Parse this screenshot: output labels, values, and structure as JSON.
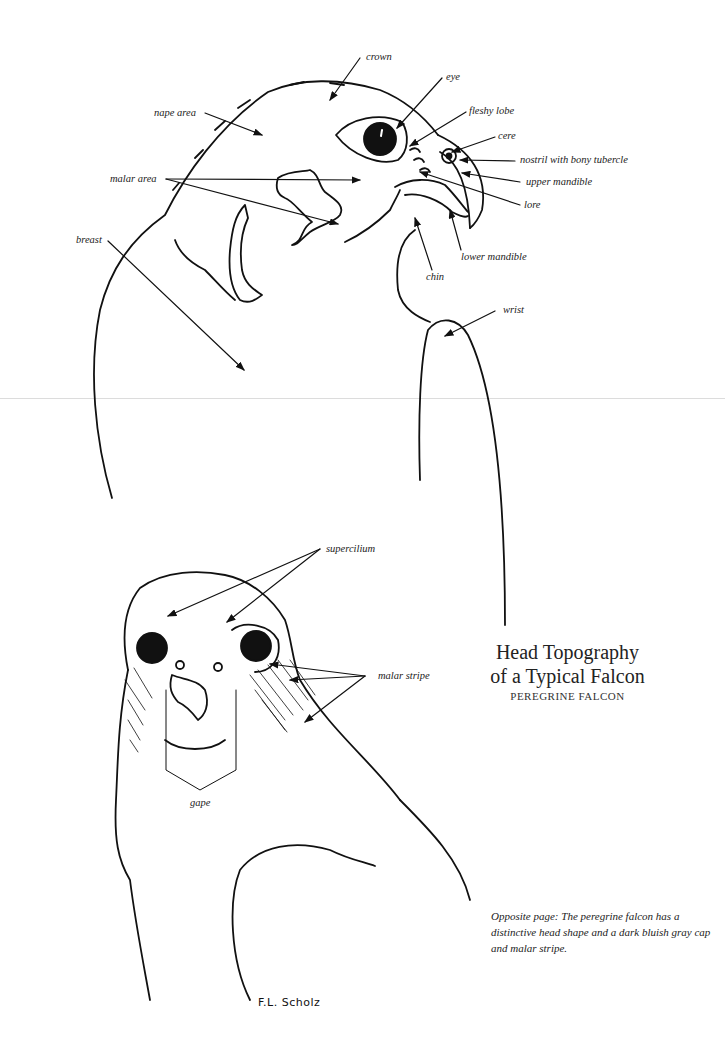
{
  "page": {
    "title_line1": "Head Topography",
    "title_line2": "of a Typical Falcon",
    "subtitle": "PEREGRINE FALCON",
    "caption": "Opposite page: The peregrine falcon has a distinctive head shape and a dark bluish gray cap and malar stripe.",
    "signature": "F.L. Scholz"
  },
  "profile_view": {
    "labels": {
      "crown": "crown",
      "eye": "eye",
      "fleshy_lobe": "fleshy lobe",
      "cere": "cere",
      "nostril": "nostril with bony tubercle",
      "upper_mandible": "upper mandible",
      "lore": "lore",
      "lower_mandible": "lower mandible",
      "chin": "chin",
      "wrist": "wrist",
      "nape_area": "nape area",
      "malar_area": "malar area",
      "breast": "breast"
    }
  },
  "front_view": {
    "labels": {
      "supercilium": "supercilium",
      "malar_stripe": "malar stripe",
      "gape": "gape"
    }
  },
  "colors": {
    "ink": "#111111",
    "background": "#ffffff",
    "fold_line": "#dcdcdc"
  }
}
